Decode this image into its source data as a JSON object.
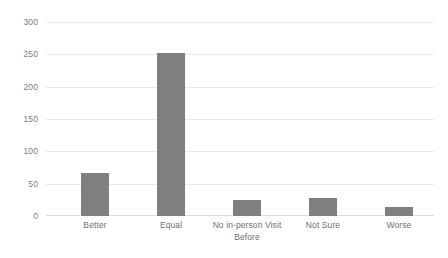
{
  "chart_data": {
    "type": "bar",
    "title": "",
    "subtitle": "",
    "xlabel": "",
    "ylabel": "",
    "categories": [
      "Better",
      "No in-person Visit Before",
      "Not Sure",
      "Worse",
      "Equal"
    ],
    "bars": [
      {
        "label_line1": "Better",
        "label_line2": "",
        "value": 66
      },
      {
        "label_line1": "Equal",
        "label_line2": "",
        "value": 252
      },
      {
        "label_line1": "No in-person Visit",
        "label_line2": "Before",
        "value": 24
      },
      {
        "label_line1": "Not Sure",
        "label_line2": "",
        "value": 28
      },
      {
        "label_line1": "Worse",
        "label_line2": "",
        "value": 14
      }
    ],
    "values": [
      66,
      252,
      24,
      28,
      14
    ],
    "ylim": [
      0,
      300
    ],
    "ytick_step": 50,
    "yticks": [
      "0",
      "50",
      "100",
      "150",
      "200",
      "250",
      "300"
    ],
    "grid": "horizontal",
    "legend": "none",
    "bar_color": "#7f7f7f",
    "gridline_color": "#e9e9e9",
    "axis_text_color": "#7b7b7b",
    "background_color": "#ffffff"
  }
}
